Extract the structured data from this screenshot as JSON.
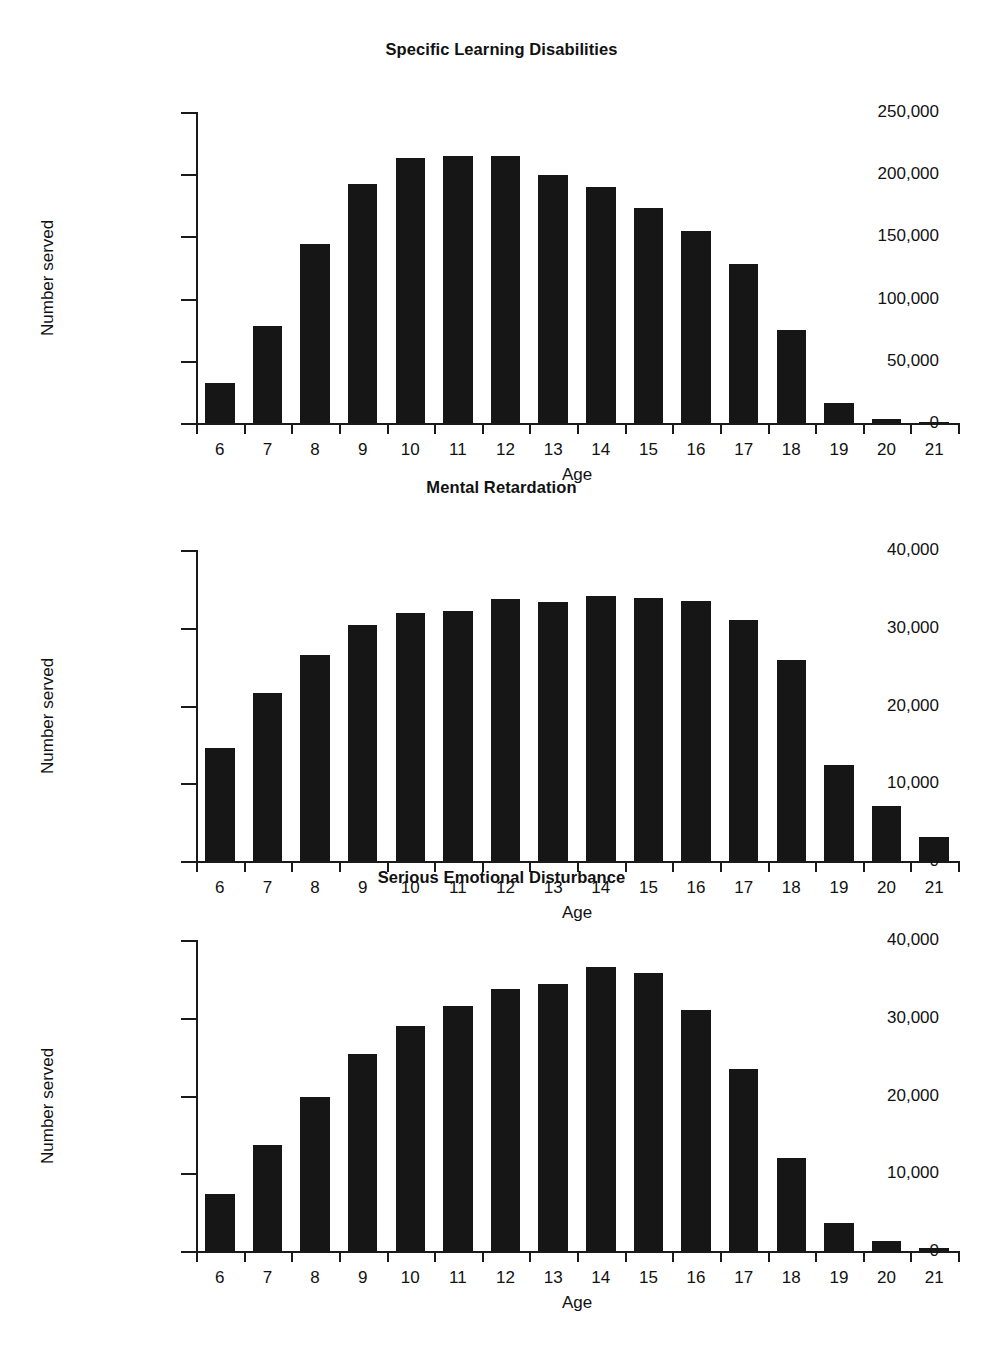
{
  "figure": {
    "background": "#ffffff",
    "bar_color": "#161616",
    "axis_color": "#1a1a1a"
  },
  "chart_data": [
    {
      "type": "bar",
      "title": "Specific Learning Disabilities",
      "xlabel": "Age",
      "ylabel": "Number served",
      "categories": [
        "6",
        "7",
        "8",
        "9",
        "10",
        "11",
        "12",
        "13",
        "14",
        "15",
        "16",
        "17",
        "18",
        "19",
        "20",
        "21"
      ],
      "values": [
        32000,
        78000,
        144000,
        192000,
        213000,
        215000,
        215000,
        199000,
        190000,
        173000,
        154000,
        128000,
        75000,
        16000,
        3000,
        1000
      ],
      "ylim": [
        0,
        250000
      ],
      "yticks": [
        0,
        50000,
        100000,
        150000,
        200000,
        250000
      ],
      "ytick_labels": [
        "0",
        "50,000",
        "100,000",
        "150,000",
        "200,000",
        "250,000"
      ],
      "grid": false,
      "legend": "none"
    },
    {
      "type": "bar",
      "title": "Mental Retardation",
      "xlabel": "Age",
      "ylabel": "Number served",
      "categories": [
        "6",
        "7",
        "8",
        "9",
        "10",
        "11",
        "12",
        "13",
        "14",
        "15",
        "16",
        "17",
        "18",
        "19",
        "20",
        "21"
      ],
      "values": [
        14500,
        21600,
        26500,
        30300,
        31900,
        32200,
        33700,
        33300,
        34100,
        33800,
        33500,
        31000,
        25800,
        12400,
        7100,
        3100
      ],
      "ylim": [
        0,
        40000
      ],
      "yticks": [
        0,
        10000,
        20000,
        30000,
        40000
      ],
      "ytick_labels": [
        "0",
        "10,000",
        "20,000",
        "30,000",
        "40,000"
      ],
      "grid": false,
      "legend": "none"
    },
    {
      "type": "bar",
      "title": "Serious Emotional Disturbance",
      "xlabel": "Age",
      "ylabel": "Number served",
      "categories": [
        "6",
        "7",
        "8",
        "9",
        "10",
        "11",
        "12",
        "13",
        "14",
        "15",
        "16",
        "17",
        "18",
        "19",
        "20",
        "21"
      ],
      "values": [
        7300,
        13600,
        19800,
        25300,
        29000,
        31500,
        33700,
        34300,
        36500,
        35800,
        31000,
        23400,
        11900,
        3600,
        1300,
        400
      ],
      "ylim": [
        0,
        40000
      ],
      "yticks": [
        0,
        10000,
        20000,
        30000,
        40000
      ],
      "ytick_labels": [
        "0",
        "10,000",
        "20,000",
        "30,000",
        "40,000"
      ],
      "grid": false,
      "legend": "none"
    }
  ]
}
